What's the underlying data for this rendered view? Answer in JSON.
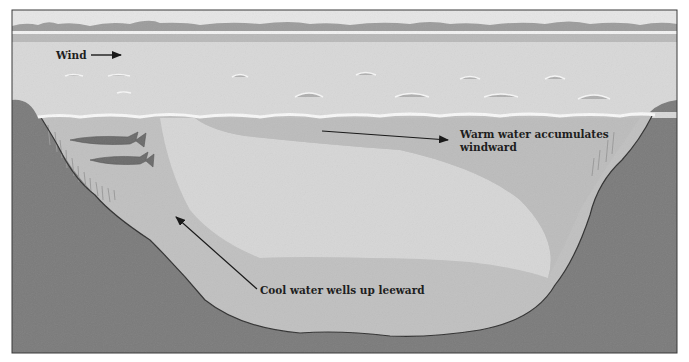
{
  "diagram": {
    "labels": {
      "wind": "Wind",
      "warm_line1": "Warm water accumulates",
      "warm_line2": "windward",
      "cool": "Cool water wells up leeward"
    },
    "regions": [
      {
        "name": "sky",
        "color": "#e6e6e6"
      },
      {
        "name": "treeline",
        "color": "#9a9a9a"
      },
      {
        "name": "lake-surface",
        "color": "#d7d7d7"
      },
      {
        "name": "warm-water-layer",
        "color": "#bdbdbd"
      },
      {
        "name": "cool-upwelling-water",
        "color": "#c2c2c2"
      },
      {
        "name": "central-water-mass",
        "color": "#d6d6d6"
      },
      {
        "name": "lake-bed-ground",
        "color": "#7d7d7d"
      }
    ],
    "fish_count": 2,
    "arrows": [
      {
        "name": "wind-arrow",
        "direction": "right"
      },
      {
        "name": "warm-water-arrow",
        "direction": "right"
      },
      {
        "name": "cool-water-arrow",
        "direction": "up-left"
      }
    ]
  }
}
